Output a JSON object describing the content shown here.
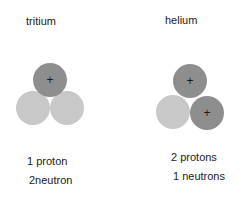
{
  "atoms": [
    {
      "name": "tritium",
      "line1": "1 proton",
      "line2": "2neutron",
      "particles": [
        {
          "type": "proton",
          "cx": 50,
          "cy": 80,
          "r": 17
        },
        {
          "type": "neutron",
          "cx": 33,
          "cy": 108,
          "r": 17
        },
        {
          "type": "neutron",
          "cx": 67,
          "cy": 108,
          "r": 17
        }
      ]
    },
    {
      "name": "helium",
      "line1": "2 protons",
      "line2": "1 neutrons",
      "particles": [
        {
          "type": "proton",
          "cx": 190,
          "cy": 81,
          "r": 17
        },
        {
          "type": "neutron",
          "cx": 173,
          "cy": 112,
          "r": 17
        },
        {
          "type": "proton",
          "cx": 207,
          "cy": 113,
          "r": 17
        }
      ]
    }
  ],
  "colors": {
    "proton": "#8e8e8e",
    "neutron": "#c8c8c8",
    "plus": "#1a1a1a"
  },
  "proton_symbol": "+"
}
